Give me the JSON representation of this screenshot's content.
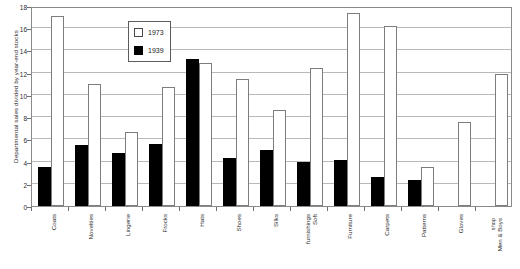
{
  "chart_data": {
    "type": "bar",
    "title": "",
    "xlabel": "",
    "ylabel": "Departmental sales divided by year-end stocks",
    "ylim": [
      0,
      18
    ],
    "ytick_step": 2,
    "yticks": [
      0,
      2,
      4,
      6,
      8,
      10,
      12,
      14,
      16,
      18
    ],
    "grid": true,
    "legend_position": "top-left-inside",
    "categories": [
      "Coats",
      "Novelties",
      "Lingerie",
      "Frocks",
      "Hats",
      "Shoes",
      "Silks",
      "Soft furnishings",
      "Furniture",
      "Carpets",
      "Patterns",
      "Gloves",
      "Men & Boys shop"
    ],
    "series": [
      {
        "name": "1973",
        "color": "#ffffff",
        "values": [
          17.1,
          11.0,
          6.7,
          10.7,
          12.9,
          11.4,
          8.6,
          12.4,
          17.4,
          16.2,
          3.5,
          7.6,
          11.9
        ]
      },
      {
        "name": "1939",
        "color": "#000000",
        "values": [
          3.5,
          5.5,
          4.8,
          5.6,
          13.2,
          4.3,
          5.0,
          4.0,
          4.1,
          2.6,
          2.3,
          null,
          null
        ]
      }
    ]
  },
  "legend": {
    "items": [
      {
        "label": "1973",
        "swatch": "white-square"
      },
      {
        "label": "1939",
        "swatch": "black-square"
      }
    ]
  }
}
